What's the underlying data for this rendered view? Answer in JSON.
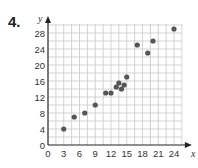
{
  "problem_number": "4.",
  "chart_data": {
    "type": "scatter",
    "title": "",
    "xlabel": "x",
    "ylabel": "y",
    "xlim": [
      0,
      25.5
    ],
    "ylim": [
      0,
      31
    ],
    "xticks": [
      0,
      3,
      6,
      9,
      12,
      15,
      18,
      21,
      24
    ],
    "yticks": [
      0,
      4,
      8,
      12,
      16,
      20,
      24,
      28
    ],
    "grid": true,
    "points": [
      {
        "x": 3,
        "y": 4
      },
      {
        "x": 5,
        "y": 7
      },
      {
        "x": 7,
        "y": 8
      },
      {
        "x": 9,
        "y": 10
      },
      {
        "x": 11,
        "y": 13
      },
      {
        "x": 12,
        "y": 13
      },
      {
        "x": 13,
        "y": 14.5
      },
      {
        "x": 13.5,
        "y": 15.5
      },
      {
        "x": 14,
        "y": 14
      },
      {
        "x": 14.5,
        "y": 15
      },
      {
        "x": 15,
        "y": 17
      },
      {
        "x": 17,
        "y": 25
      },
      {
        "x": 19,
        "y": 23
      },
      {
        "x": 20,
        "y": 26
      },
      {
        "x": 24,
        "y": 29
      }
    ],
    "point_color": "#555555",
    "grid_color": "#c8c8c8",
    "axis_color": "#222222"
  }
}
